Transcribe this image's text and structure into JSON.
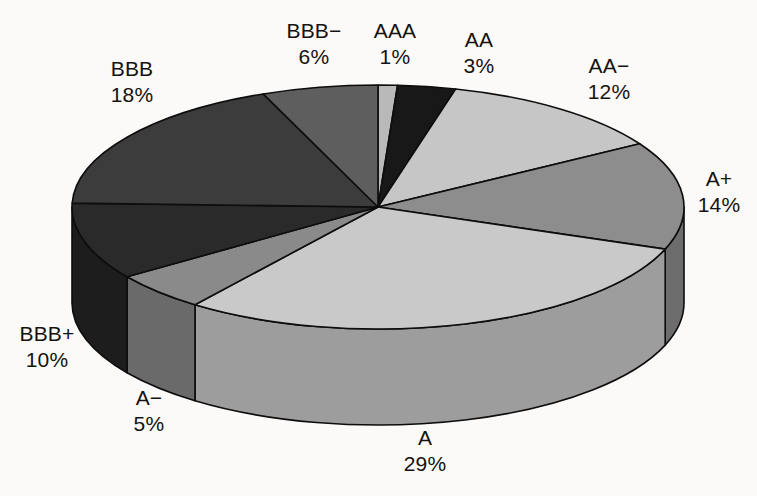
{
  "chart_data": {
    "type": "pie",
    "title": "",
    "subtitle": "",
    "xlabel": "",
    "ylabel": "",
    "grid": false,
    "legend_position": "none",
    "three_d": true,
    "value_unit": "%",
    "categories": [
      "AAA",
      "AA",
      "AA−",
      "A+",
      "A",
      "A−",
      "BBB+",
      "BBB",
      "BBB−"
    ],
    "values": [
      1,
      3,
      12,
      14,
      29,
      5,
      10,
      18,
      6
    ],
    "labels": [
      "1%",
      "3%",
      "12%",
      "14%",
      "29%",
      "5%",
      "10%",
      "18%",
      "6%"
    ],
    "slice_colors": [
      "#b9b9b9",
      "#181818",
      "#c6c6c6",
      "#8d8d8d",
      "#c9c9c9",
      "#8a8a8a",
      "#2a2a2a",
      "#3c3c3c",
      "#5e5e5e"
    ],
    "side_colors": [
      "#8d8d8d",
      "#101010",
      "#9a9a9a",
      "#6d6d6d",
      "#9d9d9d",
      "#6a6a6a",
      "#1d1d1d",
      "#2c2c2c",
      "#474747"
    ],
    "start_angle_deg": 0,
    "direction": "clockwise",
    "total": 98,
    "background_color": "#fbfaf8",
    "outline_color": "#0d0d0d",
    "text_color": "#15120f",
    "slices": [
      {
        "name": "AAA",
        "value": 1,
        "label": "1%",
        "color": "#b9b9b9",
        "side": "#8d8d8d"
      },
      {
        "name": "AA",
        "value": 3,
        "label": "3%",
        "color": "#181818",
        "side": "#101010"
      },
      {
        "name": "AA−",
        "value": 12,
        "label": "12%",
        "color": "#c6c6c6",
        "side": "#9a9a9a"
      },
      {
        "name": "A+",
        "value": 14,
        "label": "14%",
        "color": "#8d8d8d",
        "side": "#6d6d6d"
      },
      {
        "name": "A",
        "value": 29,
        "label": "29%",
        "color": "#c9c9c9",
        "side": "#9d9d9d"
      },
      {
        "name": "A−",
        "value": 5,
        "label": "5%",
        "color": "#8a8a8a",
        "side": "#6a6a6a"
      },
      {
        "name": "BBB+",
        "value": 10,
        "label": "10%",
        "color": "#2a2a2a",
        "side": "#1d1d1d"
      },
      {
        "name": "BBB",
        "value": 18,
        "label": "18%",
        "color": "#3c3c3c",
        "side": "#2c2c2c"
      },
      {
        "name": "BBB−",
        "value": 6,
        "label": "6%",
        "color": "#5e5e5e",
        "side": "#474747"
      }
    ]
  },
  "labels": {
    "bbb": {
      "name": "BBB",
      "value": "18%"
    },
    "bbb_minus": {
      "name": "BBB−",
      "value": "6%"
    },
    "aaa": {
      "name": "AAA",
      "value": "1%"
    },
    "aa": {
      "name": "AA",
      "value": "3%"
    },
    "aa_minus": {
      "name": "AA−",
      "value": "12%"
    },
    "a_plus": {
      "name": "A+",
      "value": "14%"
    },
    "a": {
      "name": "A",
      "value": "29%"
    },
    "a_minus": {
      "name": "A−",
      "value": "5%"
    },
    "bbb_plus": {
      "name": "BBB+",
      "value": "10%"
    }
  }
}
